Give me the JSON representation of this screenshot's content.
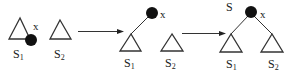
{
  "diagram": {
    "type": "tree-transformation",
    "colors": {
      "stroke": "#333333",
      "node_fill": "#111111",
      "background": "#ffffff"
    },
    "stages": [
      {
        "id": "stage-1",
        "node_label": "x",
        "root_label": "",
        "subtrees": [
          {
            "main": "S",
            "sub": "1"
          },
          {
            "main": "S",
            "sub": "2"
          }
        ]
      },
      {
        "id": "stage-2",
        "node_label": "x",
        "root_label": "",
        "subtrees": [
          {
            "main": "S",
            "sub": "1"
          },
          {
            "main": "S",
            "sub": "2"
          }
        ]
      },
      {
        "id": "stage-3",
        "node_label": "x",
        "root_label": "S",
        "subtrees": [
          {
            "main": "S",
            "sub": "1"
          },
          {
            "main": "S",
            "sub": "2"
          }
        ]
      }
    ],
    "arrows": [
      {
        "from": "stage-1",
        "to": "stage-2"
      },
      {
        "from": "stage-2",
        "to": "stage-3"
      }
    ]
  }
}
